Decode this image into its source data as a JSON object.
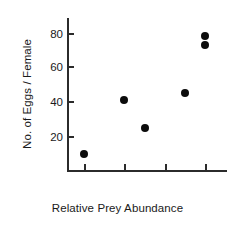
{
  "chart_data": {
    "type": "scatter",
    "title": "",
    "xlabel": "Relative Prey Abundance",
    "ylabel": "No. of Eggs / Female",
    "xlim": [
      0.5,
      4.5
    ],
    "ylim": [
      0,
      88
    ],
    "xticks": [
      1,
      2,
      3,
      4
    ],
    "xtick_labels": [
      "1",
      "2",
      "3",
      "4"
    ],
    "yticks": [
      20,
      40,
      60,
      80
    ],
    "ytick_labels": [
      "20",
      "40",
      "60",
      "80"
    ],
    "grid": false,
    "legend": null,
    "marker": "filled-circle",
    "marker_color": "#0c0c0c",
    "axis_color": "#2b2b2b",
    "points": [
      {
        "x": 1.0,
        "y": 9
      },
      {
        "x": 2.0,
        "y": 40
      },
      {
        "x": 2.5,
        "y": 24
      },
      {
        "x": 3.5,
        "y": 44
      },
      {
        "x": 4.0,
        "y": 77
      },
      {
        "x": 4.0,
        "y": 72
      }
    ]
  }
}
